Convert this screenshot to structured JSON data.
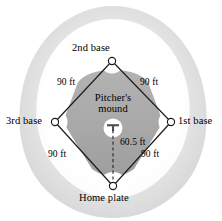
{
  "figure": {
    "type": "baseball-field-diagram"
  },
  "labels": {
    "second_base": "2nd base",
    "third_base": "3rd base",
    "first_base": "1st base",
    "home_plate": "Home plate",
    "pitchers_mound_line1": "Pitcher's",
    "pitchers_mound_line2": "mound"
  },
  "distances": {
    "home_to_first": "90 ft",
    "first_to_second": "90 ft",
    "second_to_third": "90 ft",
    "third_to_home": "90 ft",
    "home_to_mound": "60.5 ft"
  },
  "colors": {
    "outfield_outer": "#dcdcdc",
    "outfield_inner": "#ebebeb",
    "infield_grass": "#ffffff",
    "infield_dirt": "#a9a9a9",
    "baseline": "#1a1a1a",
    "base_marker_fill": "#ffffff",
    "base_marker_stroke": "#1a1a1a",
    "mound_fill": "#ffffff",
    "rubber": "#555555",
    "text": "#000000"
  },
  "geometry": {
    "second_base": {
      "x": 112,
      "y": 61
    },
    "third_base": {
      "x": 55,
      "y": 122
    },
    "first_base": {
      "x": 171,
      "y": 122
    },
    "home_plate": {
      "x": 113,
      "y": 186
    },
    "pitchers_mound": {
      "x": 113,
      "y": 128
    }
  }
}
